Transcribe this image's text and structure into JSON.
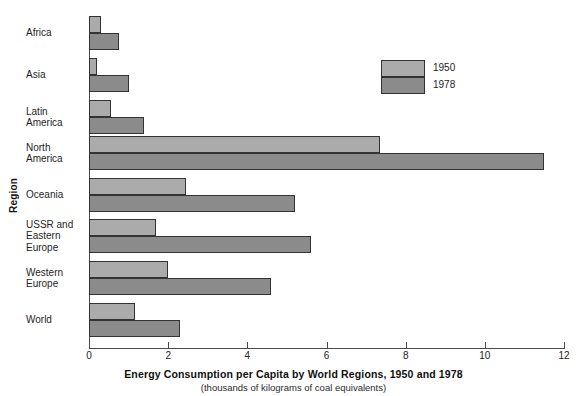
{
  "chart_data": {
    "type": "bar",
    "orientation": "horizontal",
    "title": "Energy Consumption per Capita by World Regions, 1950 and 1978",
    "subtitle": "(thousands of kilograms of coal equivalents)",
    "xlabel": "",
    "ylabel": "Region",
    "xlim": [
      0,
      12
    ],
    "xticks": [
      0,
      2,
      4,
      6,
      8,
      10,
      12
    ],
    "xticklabels": [
      "0",
      "2",
      "4",
      "6",
      "8",
      "10",
      "12"
    ],
    "grid": false,
    "legend_position": "upper right",
    "categories": [
      "Africa",
      "Asia",
      "Latin America",
      "North America",
      "Oceania",
      "USSR and Eastern Europe",
      "Western Europe",
      "World"
    ],
    "series": [
      {
        "name": "1950",
        "color": "#ababab",
        "values": [
          0.3,
          0.2,
          0.55,
          7.35,
          2.45,
          1.7,
          2.0,
          1.15
        ]
      },
      {
        "name": "1978",
        "color": "#8b8b8b",
        "values": [
          0.75,
          1.0,
          1.4,
          11.5,
          5.2,
          5.6,
          4.6,
          2.3
        ]
      }
    ]
  },
  "axes": {
    "y_title": "Region",
    "category_labels": [
      [
        "Africa"
      ],
      [
        "Asia"
      ],
      [
        "Latin",
        "America"
      ],
      [
        "North",
        "America"
      ],
      [
        "Oceania"
      ],
      [
        "USSR and",
        "Eastern",
        "Europe"
      ],
      [
        "Western",
        "Europe"
      ],
      [
        "World"
      ]
    ]
  },
  "legend": {
    "items": [
      {
        "label": "1950",
        "swatch": "light-gray-swatch"
      },
      {
        "label": "1978",
        "swatch": "dark-gray-swatch"
      }
    ]
  },
  "caption": {
    "main": "Energy Consumption per Capita by World Regions, 1950 and 1978",
    "sub": "(thousands of kilograms of coal equivalents)"
  },
  "colors": {
    "series_1950": "#ababab",
    "series_1978": "#8b8b8b",
    "axis": "#4a4a4a",
    "bar_outline": "#333333",
    "background": "#ffffff"
  }
}
